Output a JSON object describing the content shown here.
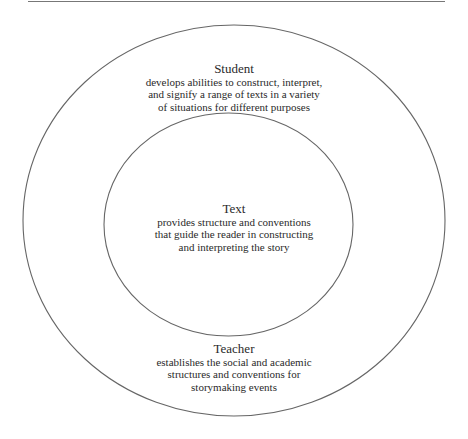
{
  "diagram": {
    "type": "concentric-circles",
    "rule": {
      "x1": 28,
      "x2": 445,
      "y": 1.5,
      "color": "#777777"
    },
    "outer": {
      "cx": 234,
      "cy": 220.5,
      "rx": 211,
      "ry": 195.5,
      "stroke": "#666666"
    },
    "inner": {
      "cx": 228.5,
      "cy": 224.5,
      "rx": 124.5,
      "ry": 111.5,
      "stroke": "#666666"
    },
    "student": {
      "title": "Student",
      "lines": [
        "develops abilities to construct, interpret,",
        "and signify a range of texts in a variety",
        "of situations for different purposes"
      ]
    },
    "text": {
      "title": "Text",
      "lines": [
        "provides structure and conventions",
        "that guide the reader in constructing",
        "and interpreting the story"
      ]
    },
    "teacher": {
      "title": "Teacher",
      "lines": [
        "establishes the social and academic",
        "structures and conventions for",
        "storymaking events"
      ]
    }
  }
}
